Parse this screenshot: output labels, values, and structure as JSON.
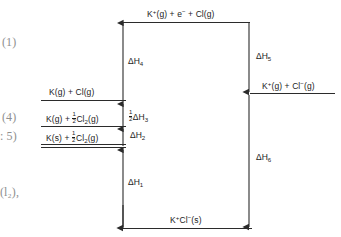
{
  "diagram": {
    "levels": [
      {
        "id": "top",
        "label_plain": "K+(g) + e- + Cl(g)",
        "label_html": "K<sup>+</sup>(g) + e<sup>−</sup> + Cl(g)"
      },
      {
        "id": "k-gas-cl-gas",
        "label_plain": "K(g) + Cl(g)",
        "label_html": "K(g) + Cl(g)"
      },
      {
        "id": "k-gas-half-cl2",
        "label_plain": "K(g) + 1/2Cl2(g)",
        "label_html": "K(g) + <span class=\"frac\"><span class=\"num\">1</span><span class=\"den\">2</span></span>Cl<sub>2</sub>(g)"
      },
      {
        "id": "k-solid-half-cl2",
        "label_plain": "K(s) + 1/2Cl2(g)",
        "label_html": "K(s) + <span class=\"frac\"><span class=\"num\">1</span><span class=\"den\">2</span></span>Cl<sub>2</sub>(g)"
      },
      {
        "id": "ions-gas",
        "label_plain": "K+(g) + Cl-(g)",
        "label_html": "K<sup>+</sup>(g) + Cl<sup>−</sup>(g)"
      },
      {
        "id": "bottom",
        "label_plain": "K+Cl-(s)",
        "label_html": "K<sup>+</sup>Cl<sup>−</sup>(s)"
      }
    ],
    "enthalpy_arrows": [
      {
        "id": "dH1",
        "label_plain": "ΔH1",
        "label_html": "ΔH<sub>1</sub>",
        "direction": "up"
      },
      {
        "id": "dH2",
        "label_plain": "ΔH2",
        "label_html": "ΔH<sub>2</sub>",
        "direction": "up"
      },
      {
        "id": "dH3",
        "label_plain": "1/2ΔH3",
        "label_html": "<span class=\"frac\"><span class=\"num\">1</span><span class=\"den\">2</span></span>ΔH<sub>3</sub>",
        "direction": "up"
      },
      {
        "id": "dH4",
        "label_plain": "ΔH4",
        "label_html": "ΔH<sub>4</sub>",
        "direction": "up"
      },
      {
        "id": "dH5",
        "label_plain": "ΔH5",
        "label_html": "ΔH<sub>5</sub>",
        "direction": "down"
      },
      {
        "id": "dH6",
        "label_plain": "ΔH6",
        "label_html": "ΔH<sub>6</sub>",
        "direction": "down"
      }
    ]
  },
  "margin_notes": [
    {
      "id": "note-1",
      "text": "(1)"
    },
    {
      "id": "note-4",
      "text": "(4)"
    },
    {
      "id": "note-5",
      "text": ": 5)"
    },
    {
      "id": "note-l2",
      "text": "(l₂),"
    }
  ],
  "colors": {
    "ink": "#1c1c1c",
    "line": "#2b2b2b",
    "margin_ink": "#8f8f8f",
    "background": "#ffffff"
  }
}
